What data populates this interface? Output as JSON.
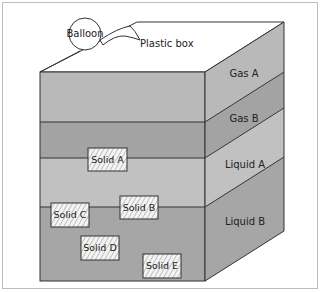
{
  "labels": {
    "balloon": "Balloon",
    "plastic_box": "Plastic box"
  },
  "layers": [
    {
      "name": "Gas A",
      "color": "#b9b9b9"
    },
    {
      "name": "Gas B",
      "color": "#a3a3a3"
    },
    {
      "name": "Liquid A",
      "color": "#c1c1c1"
    },
    {
      "name": "Liquid B",
      "color": "#a6a6a6"
    }
  ],
  "solids": [
    {
      "name": "Solid A"
    },
    {
      "name": "Solid B"
    },
    {
      "name": "Solid C"
    },
    {
      "name": "Solid D"
    },
    {
      "name": "Solid E"
    }
  ],
  "colors": {
    "top_face": "#ffffff",
    "outline": "#333333",
    "solid_fill": "#f4f4f4",
    "hatch": "#888888"
  }
}
